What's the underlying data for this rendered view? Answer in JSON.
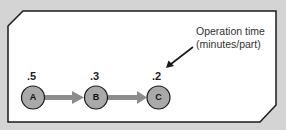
{
  "diagram": {
    "type": "process-flow",
    "nodes": [
      {
        "id": "A",
        "label": "A",
        "value": ".5"
      },
      {
        "id": "B",
        "label": "B",
        "value": ".3"
      },
      {
        "id": "C",
        "label": "C",
        "value": ".2"
      }
    ],
    "edges": [
      {
        "from": "A",
        "to": "B"
      },
      {
        "from": "B",
        "to": "C"
      }
    ],
    "annotation": {
      "line1": "Operation time",
      "line2": "(minutes/part)",
      "points_to": "C value"
    },
    "colors": {
      "background": "#d4d4d4",
      "panel": "#ffffff",
      "node_fill": "#a9a9a9",
      "node_stroke": "#1a1a1a",
      "edge": "#8c8c8c",
      "text": "#222222"
    }
  }
}
